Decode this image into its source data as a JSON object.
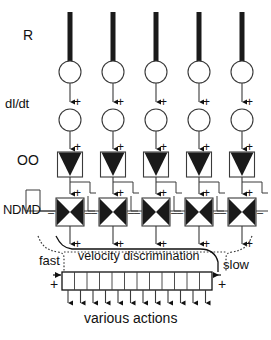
{
  "figure": {
    "title": "",
    "labels": {
      "receptor": "R",
      "derivative": "dI/dt",
      "oo": "OO",
      "ndmd": "NDMD",
      "fast": "fast",
      "slow": "slow",
      "velocity_discrimination": "velocity discrimination",
      "various_actions": "various actions"
    },
    "signs": {
      "plus": "+",
      "minus": "–"
    },
    "columns": [
      {
        "index": 0,
        "x": 70
      },
      {
        "index": 1,
        "x": 113
      },
      {
        "index": 2,
        "x": 156
      },
      {
        "index": 3,
        "x": 199
      },
      {
        "index": 4,
        "x": 242
      }
    ],
    "rows": {
      "receptor_bar": {
        "top": 12,
        "bottom": 62,
        "width": 5
      },
      "circle_1": {
        "cy": 72,
        "r": 11
      },
      "circle_2": {
        "cy": 120,
        "r": 11
      },
      "oo_box": {
        "top": 152,
        "size": 25
      },
      "ndmd_box": {
        "top": 198,
        "size": 28
      },
      "vd_box": {
        "left": 62,
        "top": 272,
        "width": 150,
        "height": 18
      }
    },
    "vd_cells": 12,
    "output_arrows": 12,
    "column_count": 5,
    "colors": {
      "ink": "#111111",
      "fill": "#1a1a1a",
      "line": "#3a3a3a",
      "background": "#ffffff"
    }
  }
}
